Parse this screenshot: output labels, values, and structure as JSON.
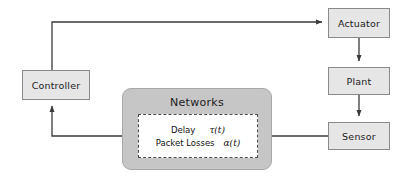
{
  "diagram": {
    "nodes": {
      "actuator": {
        "label": "Actuator"
      },
      "plant": {
        "label": "Plant"
      },
      "sensor": {
        "label": "Sensor"
      },
      "controller": {
        "label": "Controller"
      },
      "networks": {
        "label": "Networks"
      }
    },
    "network_params": [
      {
        "label": "Delay",
        "symbol": "τ(t)"
      },
      {
        "label": "Packet Losses",
        "symbol": "α(t)"
      }
    ],
    "colors": {
      "node_fill": "#e6e6e6",
      "node_border": "#8a8a8a",
      "networks_fill": "#c6c6c6",
      "networks_border": "#a8a8a8",
      "inner_fill": "#ffffff",
      "inner_border": "#4a4a4a",
      "wire": "#3a3a3a",
      "background": "#ffffff"
    },
    "connections": [
      {
        "name": "controller-to-actuator",
        "from": "controller",
        "to": "actuator"
      },
      {
        "name": "actuator-to-plant",
        "from": "actuator",
        "to": "plant"
      },
      {
        "name": "plant-to-sensor",
        "from": "plant",
        "to": "sensor"
      },
      {
        "name": "sensor-to-networks",
        "from": "sensor",
        "to": "network-params"
      },
      {
        "name": "networks-to-controller",
        "from": "network-params",
        "to": "controller"
      }
    ]
  }
}
